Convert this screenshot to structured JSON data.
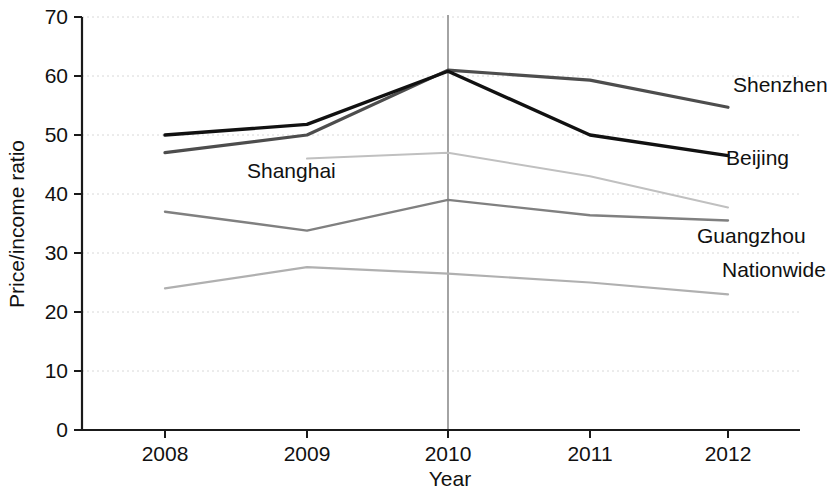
{
  "chart_data": {
    "type": "line",
    "title": "",
    "xlabel": "Year",
    "ylabel": "Price/income ratio",
    "categories": [
      "2008",
      "2009",
      "2010",
      "2011",
      "2012"
    ],
    "x": [
      2008,
      2009,
      2010,
      2011,
      2012
    ],
    "xlim": [
      2007.6,
      2012.4
    ],
    "ylim": [
      0,
      70
    ],
    "yticks": [
      "0",
      "10",
      "20",
      "30",
      "40",
      "50",
      "60",
      "70"
    ],
    "ytick_values": [
      0,
      10,
      20,
      30,
      40,
      50,
      60,
      70
    ],
    "grid": "horizontal-dotted-faint",
    "legend": "inline-right-labels",
    "annotations": [
      {
        "text": "Shanghai",
        "kind": "inline-series-label",
        "x_px": 247,
        "y_px": 178
      },
      {
        "text": "2010 reference line",
        "kind": "vertical-rule",
        "x_value": 2010
      }
    ],
    "series": [
      {
        "name": "Shenzhen",
        "color": "#4d4d4d",
        "width": 3.2,
        "label_side": "right",
        "values": [
          47.0,
          50.0,
          61.0,
          59.3,
          54.7
        ]
      },
      {
        "name": "Beijing",
        "color": "#111111",
        "width": 3.4,
        "label_side": "right",
        "values": [
          50.0,
          51.8,
          60.8,
          50.0,
          46.5
        ]
      },
      {
        "name": "Shanghai",
        "color": "#c0c0c0",
        "width": 2.0,
        "label_side": "inline",
        "values": [
          null,
          46.0,
          47.0,
          43.0,
          37.7
        ]
      },
      {
        "name": "Guangzhou",
        "color": "#808080",
        "width": 2.4,
        "label_side": "right",
        "values": [
          37.0,
          33.8,
          39.0,
          36.4,
          35.5
        ]
      },
      {
        "name": "Nationwide",
        "color": "#b0b0b0",
        "width": 2.2,
        "label_side": "right",
        "values": [
          24.0,
          27.6,
          26.5,
          25.0,
          23.0
        ]
      }
    ]
  },
  "geometry": {
    "plot_left_px": 82,
    "plot_right_px": 800,
    "plot_top_px": 17,
    "plot_bottom_px": 430,
    "x_tick_px": [
      165,
      307,
      448,
      590,
      728
    ],
    "label_positions": {
      "Shenzhen": {
        "x": 733,
        "y": 92
      },
      "Beijing": {
        "x": 726,
        "y": 165
      },
      "Guangzhou": {
        "x": 697,
        "y": 243
      },
      "Nationwide": {
        "x": 722,
        "y": 277
      }
    },
    "ylabel_px": {
      "x": 22,
      "y": 224
    },
    "xlabel_px": {
      "x": 450,
      "y": 483
    }
  }
}
